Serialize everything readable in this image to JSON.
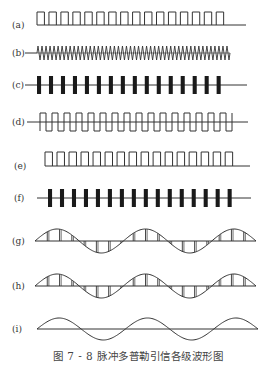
{
  "figure": {
    "caption": "图 7 - 8   脉冲多普勒引信各级波形图",
    "line_color": "#333333",
    "rows": [
      {
        "id": "a",
        "label": "(a)",
        "type": "pulse-train",
        "pulses": 16
      },
      {
        "id": "b",
        "label": "(b)",
        "type": "carrier",
        "cycles": 48
      },
      {
        "id": "c",
        "label": "(c)",
        "type": "modulated-pulses",
        "pulses": 16
      },
      {
        "id": "d",
        "label": "(d)",
        "type": "square-wave",
        "cycles": 16
      },
      {
        "id": "e",
        "label": "(e)",
        "type": "pulse-train",
        "pulses": 16
      },
      {
        "id": "f",
        "label": "(f)",
        "type": "modulated-pulses",
        "pulses": 16
      },
      {
        "id": "g",
        "label": "(g)",
        "type": "sampled-doppler",
        "cycles": 2.5,
        "samples_per_cycle": 7
      },
      {
        "id": "h",
        "label": "(h)",
        "type": "sampled-doppler",
        "cycles": 2.5,
        "samples_per_cycle": 7
      },
      {
        "id": "i",
        "label": "(i)",
        "type": "doppler-sine",
        "cycles": 2.5
      }
    ]
  }
}
